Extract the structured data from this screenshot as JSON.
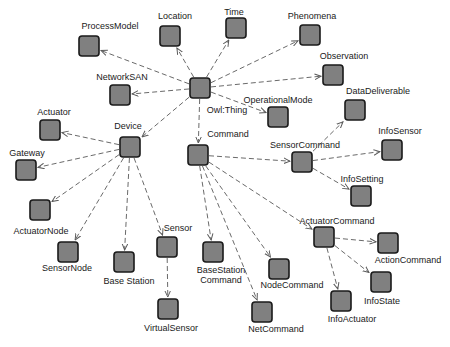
{
  "diagram": {
    "root": "Owl:Thing",
    "colors": {
      "node_fill": "#808080",
      "node_stroke": "#1a1a1a",
      "edge": "#6a6a6a",
      "label": "#1a1a1a",
      "background": "#ffffff"
    },
    "nodes": [
      {
        "id": "owl_thing",
        "label": "Owl:Thing",
        "x": 200,
        "y": 88,
        "lx": 227,
        "ly": 113,
        "anchor": "middle"
      },
      {
        "id": "process_model",
        "label": "ProcessModel",
        "x": 89,
        "y": 46,
        "lx": 110,
        "ly": 29,
        "anchor": "middle"
      },
      {
        "id": "location",
        "label": "Location",
        "x": 170,
        "y": 36,
        "lx": 175,
        "ly": 19,
        "anchor": "middle"
      },
      {
        "id": "time",
        "label": "Time",
        "x": 236,
        "y": 28,
        "lx": 234,
        "ly": 15,
        "anchor": "middle"
      },
      {
        "id": "phenomena",
        "label": "Phenomena",
        "x": 310,
        "y": 35,
        "lx": 312,
        "ly": 19,
        "anchor": "middle"
      },
      {
        "id": "network_san",
        "label": "NetworkSAN",
        "x": 120,
        "y": 95,
        "lx": 122,
        "ly": 80,
        "anchor": "middle"
      },
      {
        "id": "observation",
        "label": "Observation",
        "x": 333,
        "y": 75,
        "lx": 344,
        "ly": 59,
        "anchor": "middle"
      },
      {
        "id": "operational_mode",
        "label": "OperationalMode",
        "x": 278,
        "y": 117,
        "lx": 278,
        "ly": 103,
        "anchor": "middle"
      },
      {
        "id": "data_deliverable",
        "label": "DataDeliverable",
        "x": 355,
        "y": 110,
        "lx": 378,
        "ly": 94,
        "anchor": "middle"
      },
      {
        "id": "device",
        "label": "Device",
        "x": 130,
        "y": 147,
        "lx": 128,
        "ly": 129,
        "anchor": "middle"
      },
      {
        "id": "command",
        "label": "Command",
        "x": 198,
        "y": 155,
        "lx": 228,
        "ly": 137,
        "anchor": "middle"
      },
      {
        "id": "actuator",
        "label": "Actuator",
        "x": 50,
        "y": 130,
        "lx": 54,
        "ly": 115,
        "anchor": "middle"
      },
      {
        "id": "gateway",
        "label": "Gateway",
        "x": 26,
        "y": 170,
        "lx": 27,
        "ly": 156,
        "anchor": "middle"
      },
      {
        "id": "actuator_node",
        "label": "ActuatorNode",
        "x": 40,
        "y": 210,
        "lx": 41,
        "ly": 234,
        "anchor": "middle"
      },
      {
        "id": "sensor_node",
        "label": "SensorNode",
        "x": 68,
        "y": 252,
        "lx": 67,
        "ly": 271,
        "anchor": "middle"
      },
      {
        "id": "base_station",
        "label": "Base Station",
        "x": 124,
        "y": 262,
        "lx": 129,
        "ly": 284,
        "anchor": "middle"
      },
      {
        "id": "sensor",
        "label": "Sensor",
        "x": 167,
        "y": 247,
        "lx": 178,
        "ly": 231,
        "anchor": "middle"
      },
      {
        "id": "virtual_sensor",
        "label": "VirtualSensor",
        "x": 168,
        "y": 309,
        "lx": 171,
        "ly": 331,
        "anchor": "middle"
      },
      {
        "id": "basestation_command",
        "label": "BaseStation",
        "label2": "Command",
        "x": 213,
        "y": 252,
        "lx": 221,
        "ly": 273,
        "anchor": "middle"
      },
      {
        "id": "sensor_command",
        "label": "SensorCommand",
        "x": 302,
        "y": 162,
        "lx": 305,
        "ly": 148,
        "anchor": "middle"
      },
      {
        "id": "info_sensor",
        "label": "InfoSensor",
        "x": 392,
        "y": 150,
        "lx": 400,
        "ly": 134,
        "anchor": "middle"
      },
      {
        "id": "info_setting",
        "label": "InfoSetting",
        "x": 361,
        "y": 196,
        "lx": 362,
        "ly": 182,
        "anchor": "middle"
      },
      {
        "id": "actuator_command",
        "label": "ActuatorCommand",
        "x": 324,
        "y": 237,
        "lx": 337,
        "ly": 224,
        "anchor": "middle"
      },
      {
        "id": "action_command",
        "label": "ActionCommand",
        "x": 388,
        "y": 243,
        "lx": 408,
        "ly": 263,
        "anchor": "middle"
      },
      {
        "id": "node_command",
        "label": "NodeCommand",
        "x": 279,
        "y": 269,
        "lx": 292,
        "ly": 288,
        "anchor": "middle"
      },
      {
        "id": "info_state",
        "label": "InfoState",
        "x": 381,
        "y": 282,
        "lx": 382,
        "ly": 304,
        "anchor": "middle"
      },
      {
        "id": "info_actuator",
        "label": "InfoActuator",
        "x": 341,
        "y": 301,
        "lx": 352,
        "ly": 322,
        "anchor": "middle"
      },
      {
        "id": "net_command",
        "label": "NetCommand",
        "x": 262,
        "y": 312,
        "lx": 276,
        "ly": 332,
        "anchor": "middle"
      }
    ],
    "edges": [
      {
        "from": "owl_thing",
        "to": "process_model"
      },
      {
        "from": "owl_thing",
        "to": "location"
      },
      {
        "from": "owl_thing",
        "to": "time"
      },
      {
        "from": "owl_thing",
        "to": "phenomena"
      },
      {
        "from": "owl_thing",
        "to": "network_san"
      },
      {
        "from": "owl_thing",
        "to": "observation"
      },
      {
        "from": "owl_thing",
        "to": "operational_mode"
      },
      {
        "from": "owl_thing",
        "to": "device"
      },
      {
        "from": "owl_thing",
        "to": "command"
      },
      {
        "from": "device",
        "to": "actuator"
      },
      {
        "from": "device",
        "to": "gateway"
      },
      {
        "from": "device",
        "to": "actuator_node"
      },
      {
        "from": "device",
        "to": "sensor_node"
      },
      {
        "from": "device",
        "to": "base_station"
      },
      {
        "from": "device",
        "to": "sensor"
      },
      {
        "from": "sensor",
        "to": "virtual_sensor"
      },
      {
        "from": "command",
        "to": "basestation_command"
      },
      {
        "from": "command",
        "to": "node_command"
      },
      {
        "from": "command",
        "to": "net_command"
      },
      {
        "from": "command",
        "to": "sensor_command"
      },
      {
        "from": "command",
        "to": "actuator_command"
      },
      {
        "from": "sensor_command",
        "to": "data_deliverable"
      },
      {
        "from": "sensor_command",
        "to": "info_sensor"
      },
      {
        "from": "sensor_command",
        "to": "info_setting"
      },
      {
        "from": "actuator_command",
        "to": "action_command"
      },
      {
        "from": "actuator_command",
        "to": "info_state"
      },
      {
        "from": "actuator_command",
        "to": "info_actuator"
      }
    ]
  }
}
